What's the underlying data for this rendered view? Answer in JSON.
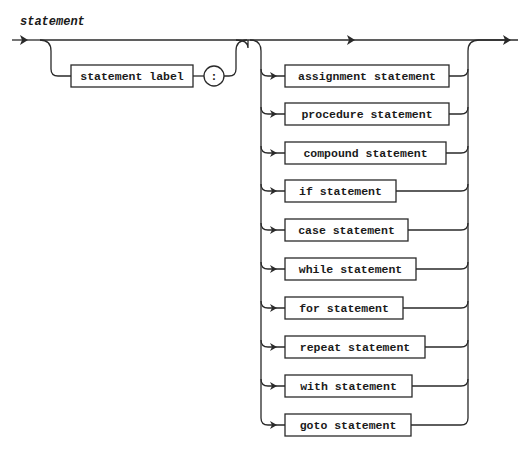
{
  "diagram": {
    "title": "statement",
    "type": "syntax-diagram",
    "prefix": {
      "label_box": "statement label",
      "separator": ":"
    },
    "alternatives": [
      {
        "label": "assignment statement",
        "cy": 76,
        "right": 449
      },
      {
        "label": "procedure statement",
        "cy": 114,
        "right": 449
      },
      {
        "label": "compound statement",
        "cy": 153,
        "right": 446
      },
      {
        "label": "if statement",
        "cy": 191,
        "right": 396
      },
      {
        "label": "case statement",
        "cy": 230,
        "right": 408
      },
      {
        "label": "while statement",
        "cy": 269,
        "right": 416
      },
      {
        "label": "for statement",
        "cy": 308,
        "right": 403
      },
      {
        "label": "repeat statement",
        "cy": 347,
        "right": 425
      },
      {
        "label": "with statement",
        "cy": 386,
        "right": 412
      },
      {
        "label": "goto statement",
        "cy": 425,
        "right": 411
      }
    ],
    "colors": {
      "stroke": "#2a2a2a",
      "background": "#ffffff",
      "text": "#1a1a1a"
    }
  }
}
